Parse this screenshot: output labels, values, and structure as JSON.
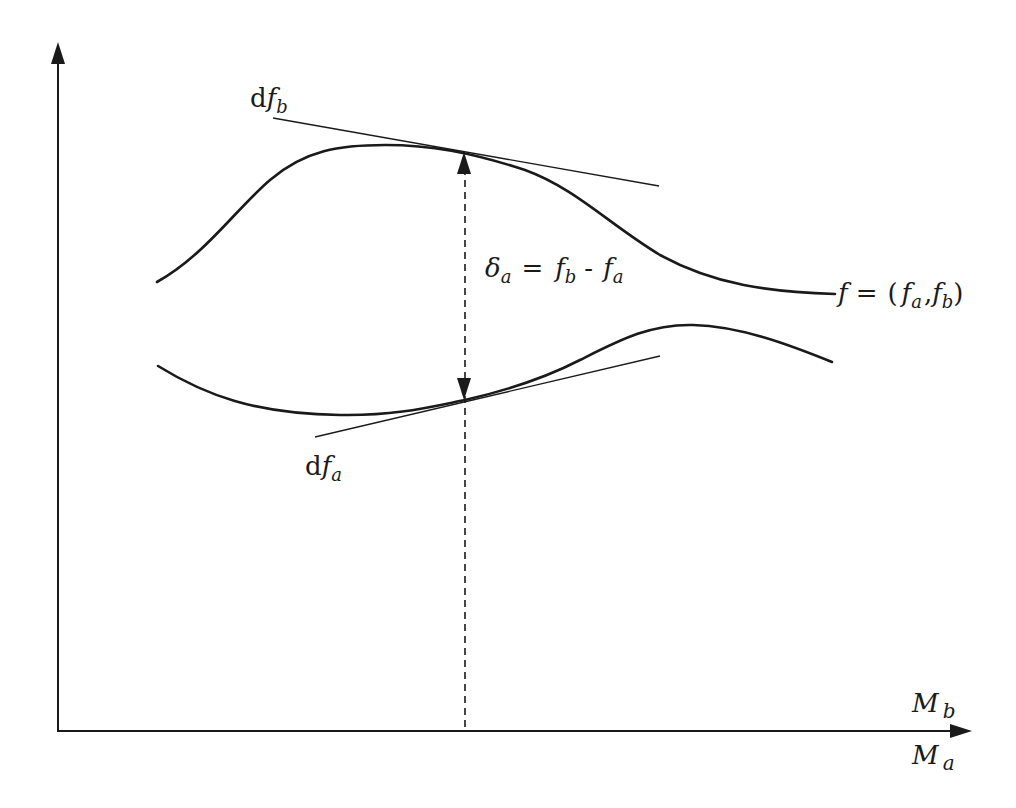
{
  "diagram": {
    "type": "function-graph-schematic",
    "axes": {
      "vertical": {
        "arrow": true
      },
      "horizontal": {
        "arrow": true,
        "label_above": {
          "base": "M",
          "sub": "b"
        },
        "label_below": {
          "base": "M",
          "sub": "a"
        }
      }
    },
    "curves": [
      {
        "id": "upper",
        "name": "f_b",
        "shape": "rise-plateau-fall"
      },
      {
        "id": "lower",
        "name": "f_a",
        "shape": "dip-rise-peak-fall"
      }
    ],
    "tangents": [
      {
        "id": "df_b",
        "label": {
          "prefix": "d",
          "base": "f",
          "sub": "b"
        },
        "curve": "upper"
      },
      {
        "id": "df_a",
        "label": {
          "prefix": "d",
          "base": "f",
          "sub": "a"
        },
        "curve": "lower"
      }
    ],
    "gap": {
      "style": "dashed-double-arrow",
      "equation": {
        "lhs": {
          "base": "δ",
          "sub": "a"
        },
        "eq": "=",
        "t1": {
          "base": "f",
          "sub": "b"
        },
        "op": "-",
        "t2": {
          "base": "f",
          "sub": "a"
        }
      }
    },
    "function_label": {
      "lhs": "f",
      "eq": "=",
      "open": "(",
      "a": {
        "base": "f",
        "sub": "a"
      },
      "comma": ",",
      "b": {
        "base": "f",
        "sub": "b"
      },
      "close": ")"
    },
    "colors": {
      "stroke": "#1a1a1a",
      "background": "#ffffff"
    }
  }
}
